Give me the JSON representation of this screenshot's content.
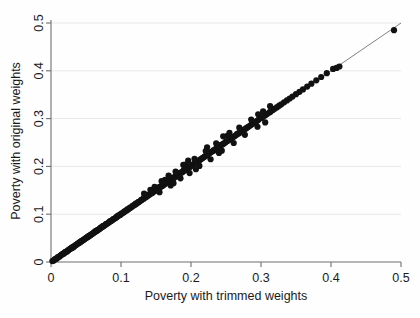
{
  "chart_data": {
    "type": "scatter",
    "title": "",
    "xlabel": "Poverty with trimmed weights",
    "ylabel": "Poverty with original weights",
    "xlim": [
      0,
      0.5
    ],
    "ylim": [
      0,
      0.5
    ],
    "xticks": [
      0,
      0.1,
      0.2,
      0.3,
      0.4,
      0.5
    ],
    "yticks": [
      0,
      0.1,
      0.2,
      0.3,
      0.4,
      0.5
    ],
    "xticklabels": [
      "0",
      "0.1",
      "0.2",
      "0.3",
      "0.4",
      "0.5"
    ],
    "yticklabels": [
      "0",
      "0.1",
      "0.2",
      "0.3",
      "0.4",
      "0.5"
    ],
    "grid": "horizontal",
    "legend": "none",
    "marker": "filled-circle",
    "marker_color": "#111111",
    "reference_line": {
      "name": "45-degree identity line",
      "from": [
        0,
        0
      ],
      "to": [
        0.5,
        0.5
      ],
      "color": "#4a4a4a"
    },
    "series": [
      {
        "name": "Poverty estimates",
        "points": [
          [
            0.002,
            0.002
          ],
          [
            0.004,
            0.003
          ],
          [
            0.005,
            0.005
          ],
          [
            0.006,
            0.006
          ],
          [
            0.008,
            0.007
          ],
          [
            0.009,
            0.009
          ],
          [
            0.01,
            0.01
          ],
          [
            0.012,
            0.011
          ],
          [
            0.013,
            0.013
          ],
          [
            0.014,
            0.014
          ],
          [
            0.015,
            0.015
          ],
          [
            0.016,
            0.016
          ],
          [
            0.017,
            0.017
          ],
          [
            0.018,
            0.017
          ],
          [
            0.019,
            0.019
          ],
          [
            0.02,
            0.02
          ],
          [
            0.021,
            0.021
          ],
          [
            0.022,
            0.022
          ],
          [
            0.023,
            0.022
          ],
          [
            0.024,
            0.024
          ],
          [
            0.025,
            0.025
          ],
          [
            0.026,
            0.026
          ],
          [
            0.027,
            0.027
          ],
          [
            0.028,
            0.028
          ],
          [
            0.029,
            0.029
          ],
          [
            0.03,
            0.03
          ],
          [
            0.031,
            0.031
          ],
          [
            0.032,
            0.031
          ],
          [
            0.033,
            0.033
          ],
          [
            0.034,
            0.034
          ],
          [
            0.035,
            0.035
          ],
          [
            0.036,
            0.036
          ],
          [
            0.037,
            0.037
          ],
          [
            0.038,
            0.038
          ],
          [
            0.039,
            0.039
          ],
          [
            0.04,
            0.04
          ],
          [
            0.041,
            0.041
          ],
          [
            0.042,
            0.042
          ],
          [
            0.043,
            0.043
          ],
          [
            0.044,
            0.044
          ],
          [
            0.045,
            0.045
          ],
          [
            0.046,
            0.046
          ],
          [
            0.047,
            0.047
          ],
          [
            0.048,
            0.048
          ],
          [
            0.049,
            0.049
          ],
          [
            0.05,
            0.05
          ],
          [
            0.051,
            0.051
          ],
          [
            0.052,
            0.052
          ],
          [
            0.053,
            0.053
          ],
          [
            0.054,
            0.054
          ],
          [
            0.055,
            0.055
          ],
          [
            0.056,
            0.056
          ],
          [
            0.057,
            0.057
          ],
          [
            0.058,
            0.058
          ],
          [
            0.059,
            0.059
          ],
          [
            0.06,
            0.06
          ],
          [
            0.061,
            0.061
          ],
          [
            0.062,
            0.062
          ],
          [
            0.063,
            0.064
          ],
          [
            0.064,
            0.064
          ],
          [
            0.065,
            0.065
          ],
          [
            0.066,
            0.066
          ],
          [
            0.067,
            0.067
          ],
          [
            0.068,
            0.068
          ],
          [
            0.069,
            0.069
          ],
          [
            0.07,
            0.07
          ],
          [
            0.071,
            0.072
          ],
          [
            0.072,
            0.072
          ],
          [
            0.073,
            0.073
          ],
          [
            0.074,
            0.075
          ],
          [
            0.075,
            0.075
          ],
          [
            0.076,
            0.076
          ],
          [
            0.078,
            0.078
          ],
          [
            0.079,
            0.08
          ],
          [
            0.08,
            0.08
          ],
          [
            0.082,
            0.082
          ],
          [
            0.083,
            0.083
          ],
          [
            0.084,
            0.085
          ],
          [
            0.085,
            0.085
          ],
          [
            0.086,
            0.086
          ],
          [
            0.088,
            0.088
          ],
          [
            0.089,
            0.09
          ],
          [
            0.09,
            0.09
          ],
          [
            0.092,
            0.092
          ],
          [
            0.093,
            0.093
          ],
          [
            0.094,
            0.095
          ],
          [
            0.095,
            0.095
          ],
          [
            0.096,
            0.097
          ],
          [
            0.098,
            0.098
          ],
          [
            0.099,
            0.099
          ],
          [
            0.1,
            0.1
          ],
          [
            0.101,
            0.102
          ],
          [
            0.103,
            0.103
          ],
          [
            0.104,
            0.104
          ],
          [
            0.105,
            0.106
          ],
          [
            0.106,
            0.106
          ],
          [
            0.108,
            0.108
          ],
          [
            0.109,
            0.11
          ],
          [
            0.11,
            0.11
          ],
          [
            0.112,
            0.112
          ],
          [
            0.113,
            0.114
          ],
          [
            0.114,
            0.114
          ],
          [
            0.116,
            0.116
          ],
          [
            0.117,
            0.118
          ],
          [
            0.118,
            0.118
          ],
          [
            0.12,
            0.12
          ],
          [
            0.121,
            0.122
          ],
          [
            0.122,
            0.122
          ],
          [
            0.124,
            0.124
          ],
          [
            0.125,
            0.126
          ],
          [
            0.126,
            0.126
          ],
          [
            0.128,
            0.128
          ],
          [
            0.129,
            0.13
          ],
          [
            0.13,
            0.13
          ],
          [
            0.132,
            0.133
          ],
          [
            0.133,
            0.133
          ],
          [
            0.134,
            0.135
          ],
          [
            0.136,
            0.136
          ],
          [
            0.137,
            0.138
          ],
          [
            0.138,
            0.138
          ],
          [
            0.14,
            0.141
          ],
          [
            0.141,
            0.141
          ],
          [
            0.142,
            0.143
          ],
          [
            0.144,
            0.144
          ],
          [
            0.145,
            0.146
          ],
          [
            0.146,
            0.146
          ],
          [
            0.148,
            0.149
          ],
          [
            0.149,
            0.149
          ],
          [
            0.15,
            0.151
          ],
          [
            0.152,
            0.152
          ],
          [
            0.153,
            0.154
          ],
          [
            0.154,
            0.154
          ],
          [
            0.155,
            0.157
          ],
          [
            0.156,
            0.156
          ],
          [
            0.158,
            0.159
          ],
          [
            0.159,
            0.159
          ],
          [
            0.16,
            0.162
          ],
          [
            0.161,
            0.161
          ],
          [
            0.163,
            0.164
          ],
          [
            0.164,
            0.164
          ],
          [
            0.165,
            0.167
          ],
          [
            0.166,
            0.166
          ],
          [
            0.168,
            0.169
          ],
          [
            0.169,
            0.169
          ],
          [
            0.17,
            0.172
          ],
          [
            0.171,
            0.171
          ],
          [
            0.173,
            0.174
          ],
          [
            0.174,
            0.174
          ],
          [
            0.175,
            0.177
          ],
          [
            0.176,
            0.176
          ],
          [
            0.178,
            0.179
          ],
          [
            0.179,
            0.179
          ],
          [
            0.18,
            0.182
          ],
          [
            0.182,
            0.182
          ],
          [
            0.183,
            0.184
          ],
          [
            0.184,
            0.185
          ],
          [
            0.185,
            0.187
          ],
          [
            0.187,
            0.187
          ],
          [
            0.188,
            0.189
          ],
          [
            0.189,
            0.19
          ],
          [
            0.19,
            0.192
          ],
          [
            0.192,
            0.192
          ],
          [
            0.193,
            0.194
          ],
          [
            0.194,
            0.195
          ],
          [
            0.195,
            0.197
          ],
          [
            0.197,
            0.197
          ],
          [
            0.198,
            0.199
          ],
          [
            0.199,
            0.2
          ],
          [
            0.201,
            0.202
          ],
          [
            0.202,
            0.203
          ],
          [
            0.204,
            0.205
          ],
          [
            0.205,
            0.206
          ],
          [
            0.207,
            0.208
          ],
          [
            0.208,
            0.209
          ],
          [
            0.21,
            0.211
          ],
          [
            0.211,
            0.212
          ],
          [
            0.213,
            0.214
          ],
          [
            0.214,
            0.215
          ],
          [
            0.216,
            0.217
          ],
          [
            0.217,
            0.218
          ],
          [
            0.219,
            0.22
          ],
          [
            0.22,
            0.221
          ],
          [
            0.222,
            0.223
          ],
          [
            0.223,
            0.224
          ],
          [
            0.225,
            0.226
          ],
          [
            0.227,
            0.228
          ],
          [
            0.228,
            0.23
          ],
          [
            0.23,
            0.231
          ],
          [
            0.232,
            0.233
          ],
          [
            0.233,
            0.234
          ],
          [
            0.235,
            0.236
          ],
          [
            0.237,
            0.238
          ],
          [
            0.238,
            0.24
          ],
          [
            0.24,
            0.241
          ],
          [
            0.242,
            0.243
          ],
          [
            0.243,
            0.245
          ],
          [
            0.245,
            0.246
          ],
          [
            0.247,
            0.248
          ],
          [
            0.249,
            0.25
          ],
          [
            0.25,
            0.252
          ],
          [
            0.252,
            0.253
          ],
          [
            0.254,
            0.255
          ],
          [
            0.256,
            0.257
          ],
          [
            0.257,
            0.259
          ],
          [
            0.259,
            0.26
          ],
          [
            0.261,
            0.262
          ],
          [
            0.263,
            0.264
          ],
          [
            0.265,
            0.266
          ],
          [
            0.266,
            0.268
          ],
          [
            0.268,
            0.269
          ],
          [
            0.27,
            0.271
          ],
          [
            0.272,
            0.273
          ],
          [
            0.274,
            0.275
          ],
          [
            0.276,
            0.277
          ],
          [
            0.278,
            0.279
          ],
          [
            0.28,
            0.281
          ],
          [
            0.282,
            0.283
          ],
          [
            0.284,
            0.285
          ],
          [
            0.286,
            0.287
          ],
          [
            0.288,
            0.289
          ],
          [
            0.29,
            0.292
          ],
          [
            0.292,
            0.293
          ],
          [
            0.294,
            0.295
          ],
          [
            0.296,
            0.297
          ],
          [
            0.298,
            0.3
          ],
          [
            0.3,
            0.301
          ],
          [
            0.302,
            0.303
          ],
          [
            0.305,
            0.306
          ],
          [
            0.307,
            0.308
          ],
          [
            0.309,
            0.31
          ],
          [
            0.312,
            0.313
          ],
          [
            0.314,
            0.315
          ],
          [
            0.317,
            0.318
          ],
          [
            0.32,
            0.321
          ],
          [
            0.323,
            0.324
          ],
          [
            0.326,
            0.327
          ],
          [
            0.329,
            0.33
          ],
          [
            0.333,
            0.334
          ],
          [
            0.337,
            0.338
          ],
          [
            0.341,
            0.342
          ],
          [
            0.345,
            0.346
          ],
          [
            0.35,
            0.351
          ],
          [
            0.355,
            0.356
          ],
          [
            0.36,
            0.361
          ],
          [
            0.366,
            0.367
          ],
          [
            0.372,
            0.373
          ],
          [
            0.379,
            0.38
          ],
          [
            0.386,
            0.387
          ],
          [
            0.394,
            0.395
          ],
          [
            0.403,
            0.404
          ],
          [
            0.408,
            0.406
          ],
          [
            0.412,
            0.409
          ],
          [
            0.49,
            0.485
          ],
          [
            0.142,
            0.151
          ],
          [
            0.148,
            0.157
          ],
          [
            0.155,
            0.146
          ],
          [
            0.163,
            0.172
          ],
          [
            0.171,
            0.16
          ],
          [
            0.178,
            0.189
          ],
          [
            0.185,
            0.175
          ],
          [
            0.192,
            0.204
          ],
          [
            0.198,
            0.186
          ],
          [
            0.205,
            0.216
          ],
          [
            0.212,
            0.201
          ],
          [
            0.221,
            0.232
          ],
          [
            0.228,
            0.215
          ],
          [
            0.236,
            0.248
          ],
          [
            0.244,
            0.233
          ],
          [
            0.252,
            0.264
          ],
          [
            0.261,
            0.249
          ],
          [
            0.269,
            0.281
          ],
          [
            0.277,
            0.266
          ],
          [
            0.286,
            0.298
          ],
          [
            0.295,
            0.283
          ],
          [
            0.303,
            0.315
          ],
          [
            0.246,
            0.263
          ],
          [
            0.189,
            0.203
          ],
          [
            0.207,
            0.194
          ],
          [
            0.223,
            0.24
          ],
          [
            0.168,
            0.181
          ],
          [
            0.133,
            0.143
          ],
          [
            0.296,
            0.309
          ],
          [
            0.306,
            0.292
          ],
          [
            0.313,
            0.326
          ],
          [
            0.196,
            0.212
          ],
          [
            0.175,
            0.165
          ],
          [
            0.158,
            0.169
          ],
          [
            0.24,
            0.228
          ],
          [
            0.255,
            0.27
          ]
        ]
      }
    ]
  }
}
